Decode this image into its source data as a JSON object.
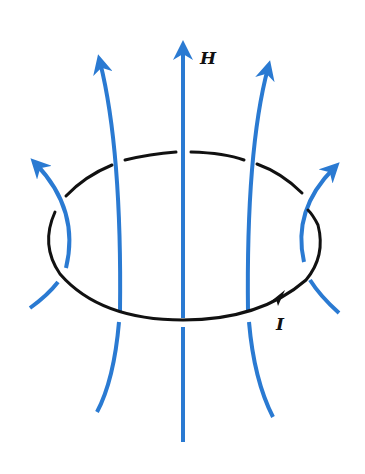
{
  "figure": {
    "labels": {
      "field": "H",
      "current": "I"
    },
    "colors": {
      "field_lines": "#2a7ad2",
      "loop": "#111111",
      "background": "#ffffff"
    }
  }
}
